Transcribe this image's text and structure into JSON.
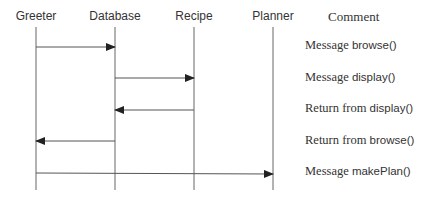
{
  "diagram": {
    "type": "sequence",
    "lifelines": [
      {
        "name": "Greeter",
        "x": 36
      },
      {
        "name": "Database",
        "x": 115
      },
      {
        "name": "Recipe",
        "x": 194
      },
      {
        "name": "Planner",
        "x": 273
      }
    ],
    "comment_header": "Comment",
    "messages": [
      {
        "from": "Greeter",
        "to": "Database",
        "y": 47,
        "comment_prefix": "Message",
        "comment_code": "browse()"
      },
      {
        "from": "Database",
        "to": "Recipe",
        "y": 78,
        "comment_prefix": "Message",
        "comment_code": "display()"
      },
      {
        "from": "Recipe",
        "to": "Database",
        "y": 110,
        "comment_prefix": "Return from",
        "comment_code": "display()"
      },
      {
        "from": "Database",
        "to": "Greeter",
        "y": 141,
        "comment_prefix": "Return from",
        "comment_code": "browse()"
      },
      {
        "from": "Greeter",
        "to": "Planner",
        "y": 173,
        "comment_prefix": "Message",
        "comment_code": "makePlan()"
      }
    ],
    "colors": {
      "line": "#555555",
      "text": "#333333"
    }
  }
}
